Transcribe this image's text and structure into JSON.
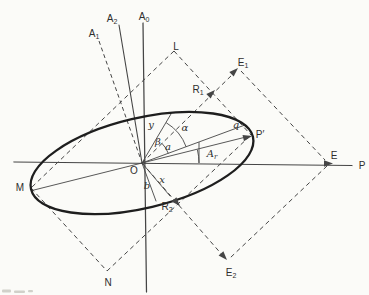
{
  "figure": {
    "canvas": {
      "width": 369,
      "height": 295
    },
    "background_color": "#fbfbf8",
    "ink_color": "#454545",
    "bold_ink_color": "#1e1e1e",
    "label_color": "#2e2e2e",
    "ellipse": {
      "name": "ellipse-curve",
      "cx": 142,
      "cy": 163,
      "rx": 114,
      "ry": 45,
      "rotation_deg": -13.3,
      "stroke_width": 2.3
    },
    "solid_lines": [
      {
        "name": "p-axis-line",
        "x1": 14,
        "y1": 162,
        "x2": 352,
        "y2": 165.5,
        "w": 1.25
      },
      {
        "name": "a0-axis-line",
        "x1": 143,
        "y1": 23,
        "x2": 146.5,
        "y2": 292,
        "w": 1.25
      },
      {
        "name": "a2-axis-line",
        "x1": 119,
        "y1": 25,
        "x2": 142,
        "y2": 163,
        "w": 1.1
      },
      {
        "name": "major-axis-line",
        "x1": 32,
        "y1": 190.5,
        "x2": 248,
        "y2": 136.5,
        "w": 0.9
      },
      {
        "name": "oq-radius-line",
        "x1": 142,
        "y1": 163,
        "x2": 245,
        "y2": 125,
        "w": 0.9
      },
      {
        "name": "y-line",
        "x1": 142,
        "y1": 163,
        "x2": 171,
        "y2": 114,
        "w": 0.9
      },
      {
        "name": "x-line",
        "x1": 142,
        "y1": 163,
        "x2": 170,
        "y2": 196,
        "w": 0.9
      },
      {
        "name": "b-line",
        "x1": 142,
        "y1": 163,
        "x2": 156,
        "y2": 201,
        "w": 0.9
      },
      {
        "name": "ar-tick-line",
        "x1": 199,
        "y1": 142.5,
        "x2": 199,
        "y2": 162.5,
        "w": 0.9
      }
    ],
    "dashed_lines": [
      {
        "name": "a1-axis-dashed",
        "x1": 99,
        "y1": 41,
        "x2": 141,
        "y2": 160,
        "dash": "4,3",
        "w": 1.0
      },
      {
        "name": "rect-side-l-m",
        "x1": 174,
        "y1": 51,
        "x2": 31,
        "y2": 188,
        "dash": "4.5,3.5",
        "w": 1.0
      },
      {
        "name": "rect-side-m-n",
        "x1": 31,
        "y1": 188,
        "x2": 107,
        "y2": 271,
        "dash": "4.5,3.5",
        "w": 1.0
      },
      {
        "name": "rect-side-n-c",
        "x1": 107,
        "y1": 271,
        "x2": 251,
        "y2": 135,
        "dash": "4.5,3.5",
        "w": 1.0
      },
      {
        "name": "rect-side-l-c",
        "x1": 174,
        "y1": 51,
        "x2": 251,
        "y2": 135,
        "dash": "4.5,3.5",
        "w": 1.0
      },
      {
        "name": "o-e1-dashed",
        "x1": 142,
        "y1": 163,
        "x2": 235,
        "y2": 72,
        "dash": "4.5,3.5",
        "w": 1.0
      },
      {
        "name": "o-e2-dashed",
        "x1": 142,
        "y1": 163,
        "x2": 224,
        "y2": 257,
        "dash": "4.5,3.5",
        "w": 1.0
      },
      {
        "name": "e1-e-dashed",
        "x1": 241,
        "y1": 71,
        "x2": 325,
        "y2": 160,
        "dash": "4.5,3.5",
        "w": 1.0
      },
      {
        "name": "e-e2-dashed",
        "x1": 327,
        "y1": 166,
        "x2": 230,
        "y2": 258,
        "dash": "4.5,3.5",
        "w": 1.0
      }
    ],
    "arcs": [
      {
        "name": "alpha-angle-arc",
        "cx": 142,
        "cy": 163,
        "r": 47,
        "a1": -59,
        "a2": -20,
        "w": 0.9
      },
      {
        "name": "beta-angle-arc",
        "cx": 142,
        "cy": 163,
        "r": 28,
        "a1": -45,
        "a2": -20,
        "w": 0.9
      },
      {
        "name": "ar-angle-arc",
        "cx": 142,
        "cy": 163,
        "r": 57,
        "a1": -13.5,
        "a2": 0,
        "w": 0.9
      }
    ],
    "arrowheads": [
      {
        "name": "e-arrowhead",
        "x": 333,
        "y": 163.5,
        "angle": 0
      },
      {
        "name": "p-prime-arrowhead",
        "x": 252,
        "y": 136,
        "angle": -14
      },
      {
        "name": "r1-arrowhead",
        "x": 215,
        "y": 90,
        "angle": -44
      },
      {
        "name": "e1-arrowhead",
        "x": 238,
        "y": 68,
        "angle": -44
      },
      {
        "name": "r2-arrowhead",
        "x": 180,
        "y": 206,
        "angle": 48
      },
      {
        "name": "e2-arrowhead",
        "x": 227,
        "y": 260,
        "angle": 48
      }
    ],
    "labels": [
      {
        "name": "label-a0",
        "text": "A",
        "sub": "0",
        "x": 144,
        "y": 16,
        "italic": false
      },
      {
        "name": "label-a2",
        "text": "A",
        "sub": "2",
        "x": 112,
        "y": 18,
        "italic": false
      },
      {
        "name": "label-a1",
        "text": "A",
        "sub": "1",
        "x": 94,
        "y": 33,
        "italic": false
      },
      {
        "name": "label-l",
        "text": "L",
        "x": 176,
        "y": 46,
        "italic": false
      },
      {
        "name": "label-e1",
        "text": "E",
        "sub": "1",
        "x": 243,
        "y": 62,
        "italic": false
      },
      {
        "name": "label-r1",
        "text": "R",
        "sub": "1",
        "x": 198,
        "y": 89,
        "italic": false
      },
      {
        "name": "label-q",
        "text": "q",
        "x": 236,
        "y": 124,
        "italic": true
      },
      {
        "name": "label-p-prime",
        "text": "P′",
        "x": 260,
        "y": 134,
        "italic": false
      },
      {
        "name": "label-e",
        "text": "E",
        "x": 334,
        "y": 155,
        "italic": false
      },
      {
        "name": "label-p",
        "text": "P",
        "x": 362,
        "y": 165,
        "italic": false
      },
      {
        "name": "label-y",
        "text": "y",
        "x": 151,
        "y": 124,
        "italic": true
      },
      {
        "name": "label-alpha",
        "text": "α",
        "x": 185,
        "y": 127,
        "italic": true
      },
      {
        "name": "label-beta",
        "text": "β",
        "x": 158,
        "y": 141,
        "italic": true
      },
      {
        "name": "label-a-semiaxis",
        "text": "a",
        "x": 168,
        "y": 146,
        "italic": true
      },
      {
        "name": "label-ar",
        "text": "A",
        "sub": "r",
        "x": 212,
        "y": 153,
        "italic": true
      },
      {
        "name": "label-o",
        "text": "O",
        "x": 134,
        "y": 170,
        "italic": false
      },
      {
        "name": "label-x",
        "text": "x",
        "x": 162,
        "y": 179,
        "italic": true
      },
      {
        "name": "label-b",
        "text": "b",
        "x": 147,
        "y": 185,
        "italic": true
      },
      {
        "name": "label-m",
        "text": "M",
        "x": 20,
        "y": 187,
        "italic": false
      },
      {
        "name": "label-r2",
        "text": "R",
        "sub": "2",
        "x": 167,
        "y": 206,
        "italic": false
      },
      {
        "name": "label-e2",
        "text": "E",
        "sub": "2",
        "x": 231,
        "y": 272,
        "italic": false
      },
      {
        "name": "label-n",
        "text": "N",
        "x": 108,
        "y": 282,
        "italic": false
      }
    ],
    "smudges": [
      {
        "name": "caption-fragment",
        "x": 2,
        "y": 289.5,
        "w": 9,
        "h": 3.0
      },
      {
        "name": "caption-fragment",
        "x": 14,
        "y": 290.5,
        "w": 11,
        "h": 2.4
      },
      {
        "name": "caption-fragment",
        "x": 28,
        "y": 290,
        "w": 5,
        "h": 2.2
      }
    ]
  }
}
